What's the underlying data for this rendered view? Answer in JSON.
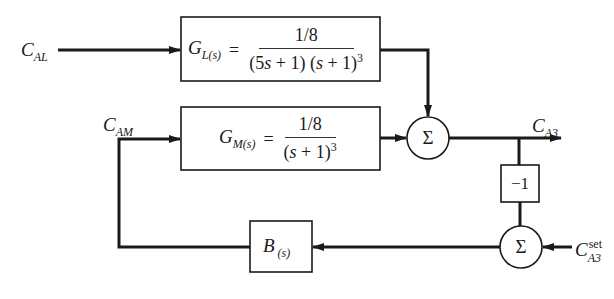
{
  "diagram": {
    "type": "block-diagram",
    "inputs": {
      "c_al": {
        "main": "C",
        "sub": "AL"
      },
      "c_am": {
        "main": "C",
        "sub": "AM"
      },
      "c_a3_set": {
        "main": "C",
        "sub": "A3",
        "sup": "set"
      }
    },
    "output": {
      "c_a3": {
        "main": "C",
        "sub": "A3"
      }
    },
    "blocks": {
      "g_l": {
        "name": "G",
        "sub": "L(s)",
        "equals": "=",
        "numerator": "1/8",
        "den_part1": "(5",
        "den_s1": "s",
        "den_part2": " + 1) (",
        "den_s2": "s",
        "den_part3": " + 1)",
        "den_exp": "3"
      },
      "g_m": {
        "name": "G",
        "sub": "M(s)",
        "equals": "=",
        "numerator": "1/8",
        "den_part1": "(",
        "den_s1": "s",
        "den_part2": " + 1)",
        "den_exp": "3"
      },
      "neg_gain": {
        "label": "−1"
      },
      "b": {
        "name": "B",
        "sub": "(s)"
      }
    },
    "summing_junctions": {
      "sum1": {
        "symbol": "Σ"
      },
      "sum2": {
        "symbol": "Σ"
      }
    },
    "connections": [
      "C_AL -> G_L(s)",
      "G_L(s) -> Sum1",
      "C_AM -> G_M(s)",
      "G_M(s) -> Sum1",
      "Sum1 -> C_A3",
      "C_A3 -> -1",
      "-1 -> Sum2",
      "C_A3_set -> Sum2",
      "Sum2 -> B(s)",
      "B(s) -> C_AM"
    ]
  }
}
